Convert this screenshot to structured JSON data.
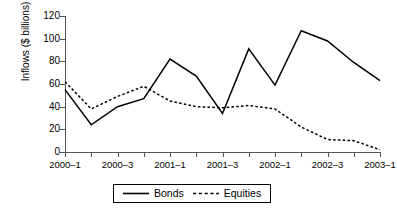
{
  "chart_data": {
    "type": "line",
    "title": "",
    "xlabel": "",
    "ylabel": "Inflows ($ billions)",
    "categories": [
      "2000-1",
      "2000-2",
      "2000-3",
      "2000-4",
      "2001-1",
      "2001-2",
      "2001-3",
      "2001-4",
      "2002-1",
      "2002-2",
      "2002-3",
      "2002-4",
      "2003-1"
    ],
    "tick_labels": [
      "2000–1",
      "2000–3",
      "2001–1",
      "2001–3",
      "2002–1",
      "2002–3",
      "2003–1"
    ],
    "ylim": [
      0,
      120
    ],
    "yticks": [
      0,
      20,
      40,
      60,
      80,
      100,
      120
    ],
    "grid": false,
    "legend_position": "bottom",
    "series": [
      {
        "name": "Bonds",
        "style": "solid",
        "color": "#000000",
        "values": [
          55,
          24,
          40,
          47,
          82,
          67,
          34,
          91,
          59,
          107,
          98,
          79,
          63
        ]
      },
      {
        "name": "Equities",
        "style": "dashed",
        "color": "#000000",
        "values": [
          62,
          38,
          49,
          58,
          45,
          40,
          39,
          41,
          38,
          22,
          11,
          10,
          2
        ]
      }
    ]
  },
  "axis": {
    "y_title": "Inflows ($ billions)"
  },
  "legend": {
    "items": [
      {
        "label": "Bonds"
      },
      {
        "label": "Equities"
      }
    ]
  }
}
